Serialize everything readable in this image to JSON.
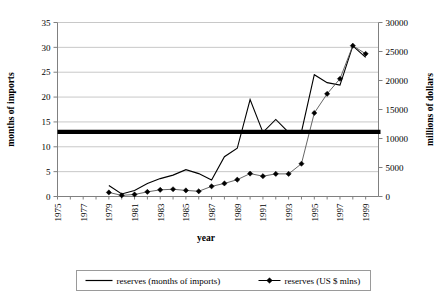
{
  "chart_data": {
    "type": "line",
    "title": "",
    "subtitle": "",
    "xlabel": "year",
    "ylabel": "months of imports",
    "y2label": "millions of dollars",
    "grid": true,
    "legend_position": "bottom",
    "x": [
      1975,
      1976,
      1977,
      1978,
      1979,
      1980,
      1981,
      1982,
      1983,
      1984,
      1985,
      1986,
      1987,
      1988,
      1989,
      1990,
      1991,
      1992,
      1993,
      1994,
      1995,
      1996,
      1997,
      1998,
      1999
    ],
    "xlim": [
      1975,
      2000
    ],
    "xticks": [
      1975,
      1977,
      1979,
      1981,
      1983,
      1985,
      1987,
      1989,
      1991,
      1993,
      1995,
      1997,
      1999
    ],
    "xtick_labels": [
      "1975",
      "1977",
      "1979",
      "1981",
      "1983",
      "1985",
      "1987",
      "1989",
      "1991",
      "1993",
      "1995",
      "1997",
      "1999"
    ],
    "ylim": [
      0,
      35
    ],
    "yticks": [
      0,
      5,
      10,
      15,
      20,
      25,
      30,
      35
    ],
    "ytick_labels": [
      "0",
      "5",
      "10",
      "15",
      "20",
      "25",
      "30",
      "35"
    ],
    "y2lim": [
      0,
      30000
    ],
    "y2ticks": [
      0,
      5000,
      10000,
      15000,
      20000,
      25000,
      30000
    ],
    "y2tick_labels": [
      "0",
      "5000",
      "10000",
      "15000",
      "20000",
      "25000",
      "30000"
    ],
    "series": [
      {
        "name": "reserves (months of imports)",
        "axis": "left",
        "marker": "none",
        "x": [
          1979,
          1980,
          1981,
          1982,
          1983,
          1984,
          1985,
          1986,
          1987,
          1988,
          1989,
          1990,
          1991,
          1992,
          1993,
          1994,
          1995,
          1996,
          1997,
          1998,
          1999
        ],
        "values": [
          2.2,
          0.5,
          1.2,
          2.6,
          3.6,
          4.3,
          5.4,
          4.6,
          3.3,
          8.0,
          9.7,
          19.5,
          12.9,
          15.5,
          12.9,
          13.0,
          24.5,
          22.9,
          22.4,
          30.3,
          28.0
        ]
      },
      {
        "name": "reserves (US $ mlns)",
        "axis": "right",
        "marker": "diamond",
        "x": [
          1979,
          1980,
          1981,
          1982,
          1983,
          1984,
          1985,
          1986,
          1987,
          1988,
          1989,
          1990,
          1991,
          1992,
          1993,
          1994,
          1995,
          1996,
          1997,
          1998,
          1999
        ],
        "values": [
          700,
          200,
          350,
          800,
          1150,
          1250,
          1050,
          900,
          1750,
          2250,
          2900,
          3950,
          3500,
          3900,
          3900,
          5650,
          14400,
          17700,
          20300,
          26000,
          24600
        ]
      }
    ],
    "reference_line": {
      "name": "reference-line",
      "axis": "left",
      "value": 13,
      "style": "thick-solid-black"
    },
    "legend_entries": [
      {
        "label": "reserves (months of imports)",
        "marker": "none"
      },
      {
        "label": "reserves (US $ mlns)",
        "marker": "diamond"
      }
    ]
  }
}
